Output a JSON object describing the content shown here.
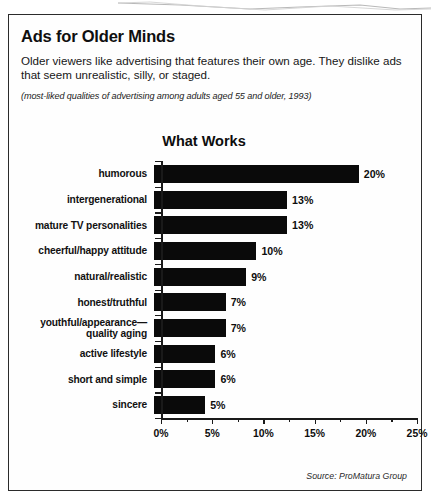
{
  "article": {
    "headline": "Ads for Older Minds",
    "lede": "Older viewers like advertising that features their own age. They dislike ads that seem unrealistic, silly, or staged.",
    "subnote": "(most-liked qualities of advertising among adults aged 55 and older, 1993)",
    "source": "Source: ProMatura Group"
  },
  "chart_data": {
    "type": "bar",
    "orientation": "horizontal",
    "title": "What Works",
    "xlabel": "",
    "ylabel": "",
    "xlim": [
      0,
      25
    ],
    "grid": false,
    "legend": null,
    "tick_labels": [
      "0%",
      "5%",
      "10%",
      "15%",
      "20%",
      "25%"
    ],
    "tick_values": [
      0,
      5,
      10,
      15,
      20,
      25
    ],
    "minor_tick_values": [
      2.5,
      7.5,
      12.5,
      17.5,
      22.5
    ],
    "categories": [
      "humorous",
      "intergenerational",
      "mature TV personalities",
      "cheerful/happy attitude",
      "natural/realistic",
      "honest/truthful",
      "youthful/appearance—\nquality aging",
      "active lifestyle",
      "short and simple",
      "sincere"
    ],
    "values": [
      20,
      13,
      13,
      10,
      9,
      7,
      7,
      6,
      6,
      5
    ],
    "value_labels": [
      "20%",
      "13%",
      "13%",
      "10%",
      "9%",
      "7%",
      "7%",
      "6%",
      "6%",
      "5%"
    ],
    "bar_color": "#0a0a0a"
  }
}
